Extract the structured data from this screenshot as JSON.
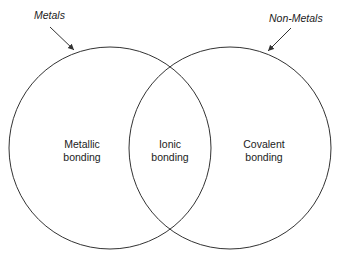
{
  "diagram": {
    "sets": [
      {
        "name": "Metals",
        "region_label_line1": "Metallic",
        "region_label_line2": "bonding"
      },
      {
        "name": "Non-Metals",
        "region_label_line1": "Covalent",
        "region_label_line2": "bonding"
      }
    ],
    "intersection": {
      "line1": "Ionic",
      "line2": "bonding"
    },
    "colors": {
      "stroke": "#333333",
      "text": "#222222"
    }
  }
}
